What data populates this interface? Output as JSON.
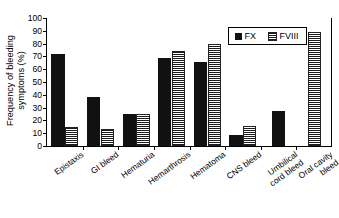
{
  "chart_data": {
    "type": "bar",
    "title": "",
    "xlabel": "",
    "ylabel": "Frequency of bleeding symptoms (%)",
    "ylabel_lines": [
      "Frequency of bleeding",
      "symptoms (%)"
    ],
    "ylim": [
      0,
      100
    ],
    "yticks": [
      0,
      10,
      20,
      30,
      40,
      50,
      60,
      70,
      80,
      90,
      100
    ],
    "ytick_labels": [
      "0",
      "10",
      "20",
      "30",
      "40",
      "50",
      "60",
      "70",
      "80",
      "90",
      "100"
    ],
    "grid": false,
    "legend_position": "upper right",
    "categories": [
      "Epistaxis",
      "GI bleed",
      "Hematuria",
      "Hemarthrosis",
      "Hematoma",
      "CNS bleed",
      "Umbilical cord bleed",
      "Oral cavity bleed"
    ],
    "category_label_lines": [
      [
        "Epistaxis"
      ],
      [
        "GI bleed"
      ],
      [
        "Hematuria"
      ],
      [
        "Hemarthrosis"
      ],
      [
        "Hematoma"
      ],
      [
        "CNS bleed"
      ],
      [
        "Umbilical",
        "cord bleed"
      ],
      [
        "Oral cavity",
        "bleed"
      ]
    ],
    "series": [
      {
        "name": "FX",
        "fill": "solid-black",
        "color": "#111111",
        "values": [
          72,
          38,
          25,
          69,
          66,
          8.5,
          27,
          null
        ]
      },
      {
        "name": "FVIII",
        "fill": "checkerboard",
        "color": "#1a1a1a",
        "values": [
          15,
          13,
          25,
          74,
          80,
          16,
          null,
          89
        ]
      }
    ]
  },
  "legend": {
    "entries": [
      {
        "label": "FX",
        "swatch": "solid-black-swatch"
      },
      {
        "label": "FVIII",
        "swatch": "checkerboard-swatch"
      }
    ]
  }
}
